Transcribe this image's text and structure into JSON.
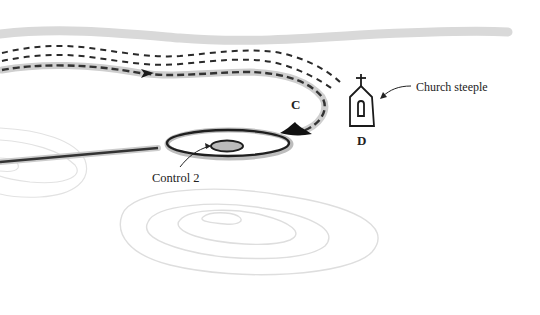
{
  "diagram": {
    "labels": {
      "point_c": "C",
      "point_d": "D",
      "church_steeple": "Church steeple",
      "control": "Control 2"
    },
    "colors": {
      "ink": "#222222",
      "road_gray": "#d9d9d9",
      "contour_gray": "#dddddd",
      "halo_gray": "#bdbdbd",
      "control_fill": "#bbbbbb",
      "background": "#ffffff"
    },
    "elements": [
      "road-band",
      "dashed-path-outer",
      "dashed-path-middle",
      "dashed-route-highlighted",
      "route-direction-arrow",
      "route-end-arrowhead",
      "church-steeple-symbol",
      "control-circle",
      "approach-line",
      "contour-lines"
    ]
  }
}
